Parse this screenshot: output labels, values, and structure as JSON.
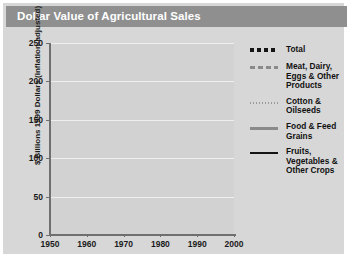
{
  "header": {
    "title": "Dollar Value of Agricultural Sales"
  },
  "colors": {
    "header_bar": "#8f8f8f",
    "page_background": "#d7d7d7",
    "plot_background": "#d2d2d2",
    "gridline": "#efefef",
    "axis": "#6f6f6f",
    "total": "#141414",
    "meat_dairy": "#8a8a8a",
    "cotton_oilseeds": "#9a9a9a",
    "food_feed_grains": "#8a8a8a",
    "fruits_vegetables": "#141414"
  },
  "axes": {
    "y_title": "$ Billions 1999 Dollars (inflation-adjusted)",
    "y_ticks": [
      "0",
      "50",
      "100",
      "150",
      "200",
      "250"
    ],
    "x_ticks": [
      "1950",
      "1960",
      "1970",
      "1980",
      "1990",
      "2000"
    ]
  },
  "legend": {
    "items": [
      {
        "label": "Total",
        "style": "thick-dashed",
        "color": "#141414"
      },
      {
        "label": "Meat, Dairy, Eggs & Other Products",
        "style": "dashed",
        "color": "#8a8a8a"
      },
      {
        "label": "Cotton & Oilseeds",
        "style": "dotted",
        "color": "#9a9a9a"
      },
      {
        "label": "Food & Feed Grains",
        "style": "solid",
        "color": "#8a8a8a"
      },
      {
        "label": "Fruits, Vegetables & Other Crops",
        "style": "solid",
        "color": "#141414"
      }
    ]
  },
  "chart_data": {
    "type": "line",
    "title": "Dollar Value of Agricultural Sales",
    "xlabel": "",
    "ylabel": "$ Billions 1999 Dollars (inflation-adjusted)",
    "xlim": [
      1950,
      2000
    ],
    "ylim": [
      0,
      250
    ],
    "grid": true,
    "legend_position": "right",
    "x": [
      1950,
      1951,
      1952,
      1953,
      1954,
      1955,
      1956,
      1957,
      1958,
      1959,
      1960,
      1961,
      1962,
      1963,
      1964,
      1965,
      1966,
      1967,
      1968,
      1969,
      1970,
      1971,
      1972,
      1973,
      1974,
      1975,
      1976,
      1977,
      1978,
      1979,
      1980,
      1981,
      1982,
      1983,
      1984,
      1985,
      1986,
      1987,
      1988,
      1989,
      1990,
      1991,
      1992,
      1993,
      1994,
      1995,
      1996,
      1997,
      1998,
      1999
    ],
    "series": [
      {
        "name": "Total",
        "style": "thick-dashed",
        "color": "#141414",
        "values": [
          168,
          176,
          170,
          158,
          157,
          152,
          152,
          150,
          163,
          152,
          156,
          160,
          162,
          160,
          156,
          166,
          172,
          166,
          166,
          170,
          172,
          178,
          196,
          265,
          252,
          231,
          233,
          226,
          243,
          256,
          240,
          244,
          219,
          203,
          213,
          196,
          178,
          180,
          190,
          198,
          197,
          189,
          193,
          186,
          190,
          196,
          208,
          198,
          186,
          184
        ]
      },
      {
        "name": "Meat, Dairy, Eggs & Other Products",
        "style": "dashed",
        "color": "#8a8a8a",
        "values": [
          100,
          104,
          99,
          90,
          88,
          84,
          84,
          85,
          95,
          88,
          89,
          91,
          92,
          91,
          88,
          95,
          100,
          95,
          95,
          98,
          98,
          100,
          108,
          132,
          118,
          108,
          116,
          110,
          122,
          131,
          120,
          121,
          110,
          104,
          108,
          100,
          93,
          94,
          101,
          106,
          105,
          100,
          102,
          98,
          97,
          98,
          103,
          100,
          95,
          93
        ]
      },
      {
        "name": "Cotton & Oilseeds",
        "style": "dotted",
        "color": "#9a9a9a",
        "values": [
          23,
          24,
          22,
          20,
          20,
          19,
          19,
          18,
          20,
          19,
          19,
          20,
          20,
          20,
          19,
          20,
          21,
          20,
          20,
          21,
          21,
          22,
          25,
          34,
          31,
          28,
          29,
          28,
          31,
          34,
          31,
          32,
          28,
          25,
          27,
          24,
          21,
          21,
          23,
          24,
          24,
          22,
          23,
          22,
          23,
          24,
          26,
          24,
          22,
          21
        ]
      },
      {
        "name": "Food & Feed Grains",
        "style": "solid",
        "color": "#8a8a8a",
        "values": [
          27,
          28,
          27,
          25,
          24,
          23,
          23,
          23,
          26,
          24,
          24,
          25,
          26,
          25,
          24,
          26,
          28,
          26,
          26,
          27,
          27,
          29,
          33,
          48,
          44,
          40,
          41,
          39,
          43,
          46,
          43,
          44,
          38,
          34,
          37,
          33,
          28,
          29,
          32,
          34,
          34,
          31,
          32,
          31,
          32,
          33,
          36,
          33,
          30,
          29
        ]
      },
      {
        "name": "Fruits, Vegetables & Other Crops",
        "style": "solid",
        "color": "#141414",
        "values": [
          26,
          27,
          26,
          25,
          24,
          24,
          24,
          24,
          26,
          25,
          25,
          26,
          26,
          26,
          25,
          27,
          28,
          27,
          27,
          28,
          28,
          29,
          31,
          37,
          35,
          33,
          34,
          33,
          35,
          37,
          35,
          36,
          34,
          32,
          34,
          33,
          32,
          33,
          35,
          36,
          37,
          36,
          37,
          37,
          38,
          39,
          41,
          40,
          39,
          39
        ]
      }
    ]
  }
}
